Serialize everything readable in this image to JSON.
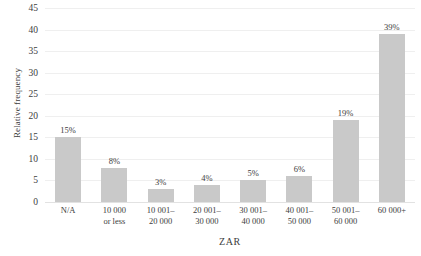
{
  "chart_data": {
    "type": "bar",
    "title": "",
    "categories": [
      "N/A",
      "10 000\nor less",
      "10 001–\n20 000",
      "20 001–\n30 000",
      "30 001–\n40 000",
      "40 001–\n50 000",
      "50 001–\n60 000",
      "60 000+"
    ],
    "values": [
      15,
      8,
      3,
      4,
      5,
      6,
      19,
      39
    ],
    "data_labels": [
      "15%",
      "8%",
      "3%",
      "4%",
      "5%",
      "6%",
      "19%",
      "39%"
    ],
    "xlabel": "ZAR",
    "ylabel": "Relative frequency",
    "ylim": [
      0,
      45
    ],
    "ytick_values": [
      0,
      5,
      10,
      15,
      20,
      25,
      30,
      35,
      40,
      45
    ],
    "ytick_labels": [
      "0",
      "5",
      "10",
      "15",
      "20",
      "25",
      "30",
      "35",
      "40",
      "45"
    ],
    "grid": true,
    "legend": false,
    "bar_color": "#c9c9c9",
    "grid_color": "#efefef",
    "text_color": "#3d3d3d"
  }
}
